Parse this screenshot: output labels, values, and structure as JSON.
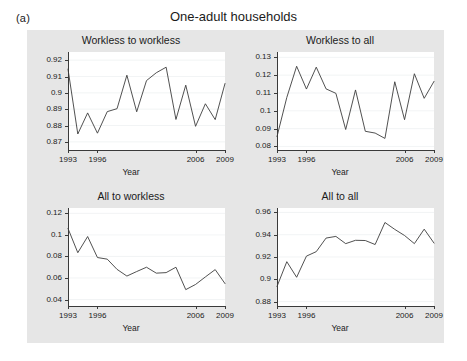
{
  "figure": {
    "panel_letter": "(a)",
    "title": "One-adult households",
    "background_color": "#e6e6e6",
    "plot_background_color": "#ffffff",
    "line_color": "#3d3d3d"
  },
  "chart_data": [
    {
      "type": "line",
      "title": "Workless to workless",
      "xlabel": "Year",
      "ylabel": "",
      "grid": true,
      "legend": null,
      "xlim": [
        1993,
        2009
      ],
      "ylim": [
        0.865,
        0.925
      ],
      "xticks": [
        1993,
        1996,
        2006,
        2009
      ],
      "yticks": [
        0.87,
        0.88,
        0.89,
        0.9,
        0.91,
        0.92
      ],
      "ytick_labels": [
        "0.87",
        "0.88",
        "0.89",
        "0.9",
        "0.91",
        "0.92"
      ],
      "x": [
        1993,
        1994,
        1995,
        1996,
        1997,
        1998,
        1999,
        2000,
        2001,
        2002,
        2003,
        2004,
        2005,
        2006,
        2007,
        2008,
        2009
      ],
      "values": [
        0.9145,
        0.8748,
        0.8877,
        0.8753,
        0.8885,
        0.8903,
        0.9108,
        0.8884,
        0.9075,
        0.9123,
        0.9157,
        0.8837,
        0.9047,
        0.8795,
        0.8933,
        0.8836,
        0.9057
      ]
    },
    {
      "type": "line",
      "title": "Workless to all",
      "xlabel": "Year",
      "ylabel": "",
      "grid": true,
      "legend": null,
      "xlim": [
        1993,
        2009
      ],
      "ylim": [
        0.078,
        0.133
      ],
      "xticks": [
        1993,
        1996,
        2006,
        2009
      ],
      "yticks": [
        0.08,
        0.09,
        0.1,
        0.11,
        0.12,
        0.13
      ],
      "ytick_labels": [
        "0.08",
        "0.09",
        "0.1",
        "0.11",
        "0.12",
        "0.13"
      ],
      "x": [
        1993,
        1994,
        1995,
        1996,
        1997,
        1998,
        1999,
        2000,
        2001,
        2002,
        2003,
        2004,
        2005,
        2006,
        2007,
        2008,
        2009
      ],
      "values": [
        0.0855,
        0.1075,
        0.125,
        0.1122,
        0.1245,
        0.1123,
        0.1098,
        0.0895,
        0.1117,
        0.0885,
        0.0875,
        0.0845,
        0.1163,
        0.095,
        0.1208,
        0.107,
        0.1165
      ]
    },
    {
      "type": "line",
      "title": "All to workless",
      "xlabel": "Year",
      "ylabel": "",
      "grid": true,
      "legend": null,
      "xlim": [
        1993,
        2009
      ],
      "ylim": [
        0.034,
        0.125
      ],
      "xticks": [
        1993,
        1996,
        2006,
        2009
      ],
      "yticks": [
        0.04,
        0.06,
        0.08,
        0.1,
        0.12
      ],
      "ytick_labels": [
        "0.04",
        "0.06",
        "0.08",
        "0.1",
        "0.12"
      ],
      "x": [
        1993,
        1994,
        1995,
        1996,
        1997,
        1998,
        1999,
        2000,
        2001,
        2002,
        2003,
        2004,
        2005,
        2006,
        2007,
        2008,
        2009
      ],
      "values": [
        0.106,
        0.0835,
        0.0985,
        0.079,
        0.0775,
        0.068,
        0.0618,
        0.066,
        0.07,
        0.0645,
        0.065,
        0.07,
        0.0492,
        0.054,
        0.061,
        0.0678,
        0.0548
      ]
    },
    {
      "type": "line",
      "title": "All to all",
      "xlabel": "Year",
      "ylabel": "",
      "grid": true,
      "legend": null,
      "xlim": [
        1993,
        2009
      ],
      "ylim": [
        0.876,
        0.964
      ],
      "xticks": [
        1993,
        1996,
        2006,
        2009
      ],
      "yticks": [
        0.88,
        0.9,
        0.92,
        0.94,
        0.96
      ],
      "ytick_labels": [
        "0.88",
        "0.9",
        "0.92",
        "0.94",
        "0.96"
      ],
      "x": [
        1993,
        1994,
        1995,
        1996,
        1997,
        1998,
        1999,
        2000,
        2001,
        2002,
        2003,
        2004,
        2005,
        2006,
        2007,
        2008,
        2009
      ],
      "values": [
        0.8935,
        0.9158,
        0.9018,
        0.9208,
        0.9248,
        0.937,
        0.9385,
        0.932,
        0.935,
        0.9348,
        0.9312,
        0.951,
        0.9448,
        0.9393,
        0.932,
        0.945,
        0.9325
      ]
    }
  ]
}
